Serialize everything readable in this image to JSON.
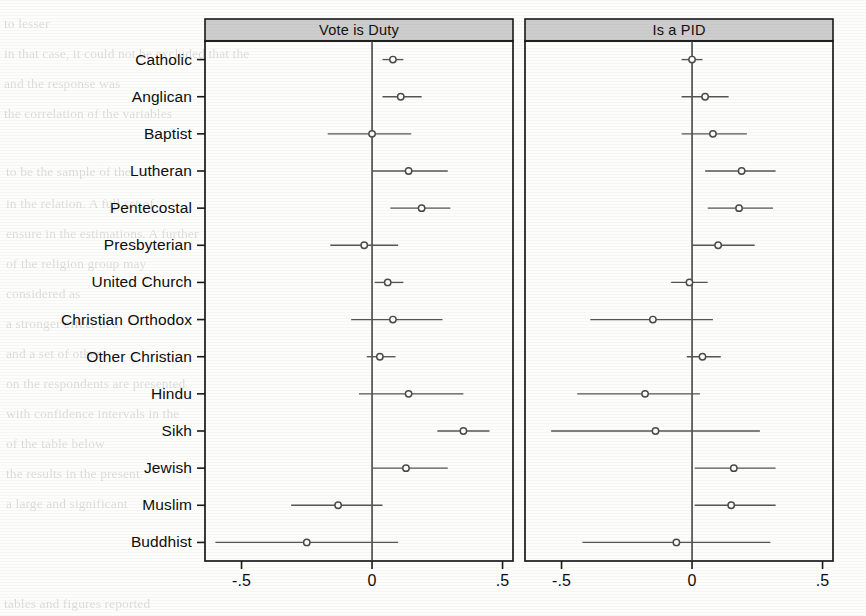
{
  "figure": {
    "type": "coefficient-plot",
    "panels": [
      {
        "id": "vote-is-duty",
        "title": "Vote is Duty"
      },
      {
        "id": "is-a-pid",
        "title": "Is a PID"
      }
    ],
    "categories": [
      "Catholic",
      "Anglican",
      "Baptist",
      "Lutheran",
      "Pentecostal",
      "Presbyterian",
      "United Church",
      "Christian Orthodox",
      "Other Christian",
      "Hindu",
      "Sikh",
      "Jewish",
      "Muslim",
      "Buddhist"
    ],
    "x_ticks": [
      "-.5",
      "0",
      ".5"
    ],
    "x_tick_values": [
      -0.5,
      0,
      0.5
    ],
    "xlim": [
      -0.64,
      0.54
    ],
    "reference_line": 0,
    "marker": "open-circle",
    "colors": {
      "panel_header_fill": "#cdcdcd",
      "frame": "#1a1a1a",
      "marker": "#4a4a4a",
      "whisker": "#555555",
      "zero_line": "#3a3a3a",
      "background": "#fdfdfb"
    }
  },
  "chart_data": {
    "type": "scatter",
    "title": "",
    "subtitle": "",
    "xlabel": "",
    "ylabel": "",
    "xlim": [
      -0.64,
      0.54
    ],
    "grid": false,
    "legend": null,
    "categories": [
      "Catholic",
      "Anglican",
      "Baptist",
      "Lutheran",
      "Pentecostal",
      "Presbyterian",
      "United Church",
      "Christian Orthodox",
      "Other Christian",
      "Hindu",
      "Sikh",
      "Jewish",
      "Muslim",
      "Buddhist"
    ],
    "series": [
      {
        "name": "Vote is Duty",
        "panel": "Vote is Duty",
        "estimates": [
          0.08,
          0.11,
          0.0,
          0.14,
          0.19,
          -0.03,
          0.06,
          0.08,
          0.03,
          0.14,
          0.35,
          0.13,
          -0.13,
          -0.25
        ],
        "ci_low": [
          0.04,
          0.04,
          -0.17,
          0.0,
          0.07,
          -0.16,
          0.01,
          -0.08,
          -0.02,
          -0.05,
          0.25,
          0.0,
          -0.31,
          -0.6
        ],
        "ci_high": [
          0.12,
          0.19,
          0.15,
          0.29,
          0.3,
          0.1,
          0.12,
          0.27,
          0.09,
          0.35,
          0.45,
          0.29,
          0.04,
          0.1
        ]
      },
      {
        "name": "Is a PID",
        "panel": "Is a PID",
        "estimates": [
          0.0,
          0.05,
          0.08,
          0.19,
          0.18,
          0.1,
          -0.01,
          -0.15,
          0.04,
          -0.18,
          -0.14,
          0.16,
          0.15,
          -0.06
        ],
        "ci_low": [
          -0.04,
          -0.04,
          -0.04,
          0.05,
          0.06,
          0.0,
          -0.08,
          -0.39,
          -0.02,
          -0.44,
          -0.54,
          0.01,
          0.01,
          -0.42
        ],
        "ci_high": [
          0.04,
          0.14,
          0.21,
          0.32,
          0.31,
          0.24,
          0.06,
          0.08,
          0.11,
          0.03,
          0.26,
          0.32,
          0.32,
          0.3
        ]
      }
    ]
  },
  "scan_bleed": [
    {
      "t": "to lesser",
      "x": 4,
      "y": 16
    },
    {
      "t": "in that case, it could not be excluded that the",
      "x": 4,
      "y": 46
    },
    {
      "t": "and the response was",
      "x": 4,
      "y": 76
    },
    {
      "t": "the correlation of the variables",
      "x": 4,
      "y": 106
    },
    {
      "t": "to be the sample of the",
      "x": 6,
      "y": 164
    },
    {
      "t": "in the relation. A full set of",
      "x": 6,
      "y": 196
    },
    {
      "t": "ensure in the estimations. A further",
      "x": 6,
      "y": 226
    },
    {
      "t": "of the religion group may",
      "x": 6,
      "y": 256
    },
    {
      "t": "considered as",
      "x": 6,
      "y": 286
    },
    {
      "t": "a stronger effect in a",
      "x": 6,
      "y": 316
    },
    {
      "t": "and a set of other",
      "x": 6,
      "y": 346
    },
    {
      "t": "on the respondents are presented",
      "x": 6,
      "y": 376
    },
    {
      "t": "with confidence intervals in the",
      "x": 6,
      "y": 406
    },
    {
      "t": "of the table below",
      "x": 6,
      "y": 436
    },
    {
      "t": "the results in the present",
      "x": 6,
      "y": 466
    },
    {
      "t": "a large and significant",
      "x": 6,
      "y": 496
    },
    {
      "t": "tables and figures reported",
      "x": 4,
      "y": 596
    }
  ]
}
